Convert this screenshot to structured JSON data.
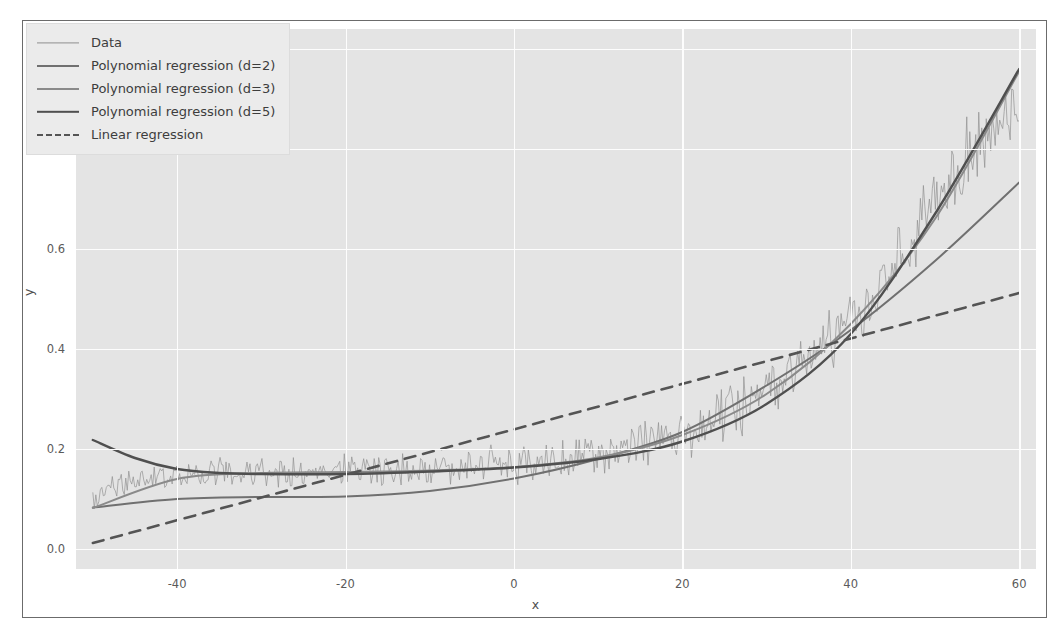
{
  "chart_data": {
    "type": "line",
    "title": "",
    "xlabel": "x",
    "ylabel": "y",
    "xlim": [
      -52,
      62
    ],
    "ylim": [
      -0.04,
      1.04
    ],
    "xticks": [
      -40,
      -20,
      0,
      20,
      40,
      60
    ],
    "yticks": [
      "0.0",
      "0.2",
      "0.4",
      "0.6",
      "0.8",
      "1.0"
    ],
    "ytick_values": [
      0.0,
      0.2,
      0.4,
      0.6,
      0.8,
      1.0
    ],
    "grid": true,
    "grid_color": "#fdfdfd",
    "plot_bg": "#e4e4e4",
    "legend_position": "upper left",
    "series": [
      {
        "name": "Data",
        "style": "noisy-line",
        "color": "#8f8f8f",
        "linewidth": 0.8,
        "description": "Noisy sigmoid-like observations rising from ~0.10 at x=-50 to ~0.90 at x=60",
        "x": [
          -50,
          -45,
          -40,
          -35,
          -30,
          -25,
          -20,
          -15,
          -10,
          -5,
          0,
          5,
          10,
          15,
          20,
          25,
          30,
          35,
          40,
          45,
          50,
          55,
          60
        ],
        "y": [
          0.105,
          0.142,
          0.148,
          0.152,
          0.155,
          0.157,
          0.158,
          0.16,
          0.163,
          0.167,
          0.172,
          0.18,
          0.192,
          0.21,
          0.235,
          0.27,
          0.315,
          0.375,
          0.455,
          0.56,
          0.685,
          0.81,
          0.905
        ],
        "noise_amplitude": 0.05
      },
      {
        "name": "Polynomial regression (d=2)",
        "style": "solid",
        "color": "#707070",
        "linewidth": 2.0,
        "degree": 2,
        "x": [
          -50,
          -40,
          -30,
          -20,
          -10,
          0,
          10,
          20,
          30,
          40,
          50,
          60
        ],
        "y": [
          0.083,
          0.1,
          0.104,
          0.105,
          0.116,
          0.141,
          0.18,
          0.234,
          0.327,
          0.438,
          0.576,
          0.733
        ]
      },
      {
        "name": "Polynomial regression (d=3)",
        "style": "solid",
        "color": "#8a8a8a",
        "linewidth": 2.0,
        "degree": 3,
        "x": [
          -50,
          -40,
          -30,
          -20,
          -10,
          0,
          10,
          20,
          30,
          40,
          50,
          60
        ],
        "y": [
          0.082,
          0.14,
          0.152,
          0.154,
          0.157,
          0.164,
          0.183,
          0.228,
          0.31,
          0.45,
          0.66,
          0.955
        ]
      },
      {
        "name": "Polynomial regression (d=5)",
        "style": "solid",
        "color": "#4f4f4f",
        "linewidth": 2.4,
        "degree": 5,
        "x": [
          -50,
          -45,
          -40,
          -35,
          -30,
          -20,
          -10,
          0,
          10,
          20,
          30,
          40,
          50,
          60
        ],
        "y": [
          0.218,
          0.182,
          0.16,
          0.152,
          0.15,
          0.15,
          0.155,
          0.163,
          0.18,
          0.215,
          0.29,
          0.43,
          0.67,
          0.96
        ]
      },
      {
        "name": "Linear regression",
        "style": "dashed",
        "color": "#545454",
        "linewidth": 2.6,
        "x": [
          -50,
          60
        ],
        "y": [
          0.012,
          0.512
        ]
      }
    ]
  },
  "legend": {
    "items": [
      {
        "label": "Data",
        "swatch": "thin-line-swatch"
      },
      {
        "label": "Polynomial regression (d=2)",
        "swatch": "medium-line-swatch"
      },
      {
        "label": "Polynomial regression (d=3)",
        "swatch": "light-line-swatch"
      },
      {
        "label": "Polynomial regression (d=5)",
        "swatch": "dark-line-swatch"
      },
      {
        "label": "Linear regression",
        "swatch": "dashed-line-swatch"
      }
    ]
  },
  "axes": {
    "xlabel": "x",
    "ylabel": "y",
    "xticklabels": [
      "-40",
      "-20",
      "0",
      "20",
      "40",
      "60"
    ],
    "yticklabels": [
      "0.0",
      "0.2",
      "0.4",
      "0.6",
      "0.8",
      "1.0"
    ]
  }
}
